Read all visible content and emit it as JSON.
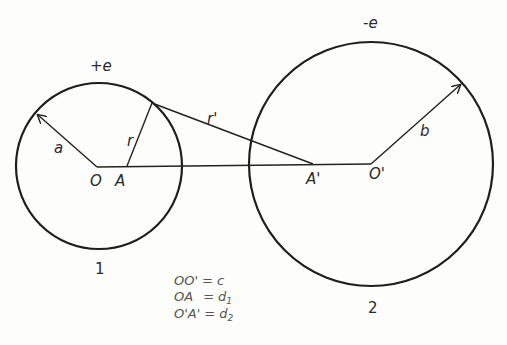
{
  "diagram": {
    "circle1": {
      "charge_label": "+e",
      "radius_label": "a",
      "number_label": "1",
      "center_label": "O"
    },
    "circle2": {
      "charge_label": "-e",
      "radius_label": "b",
      "number_label": "2",
      "center_label": "O'"
    },
    "points": {
      "A": "A",
      "A_prime": "A'"
    },
    "distances": {
      "r": "r",
      "r_prime": "r'"
    },
    "equations": [
      {
        "lhs": "OO'",
        "eq": "=",
        "rhs": "c"
      },
      {
        "lhs": "OA",
        "eq": "=",
        "rhs": "d",
        "sub": "1"
      },
      {
        "lhs": "O'A'",
        "eq": "=",
        "rhs": "d",
        "sub": "2"
      }
    ]
  }
}
